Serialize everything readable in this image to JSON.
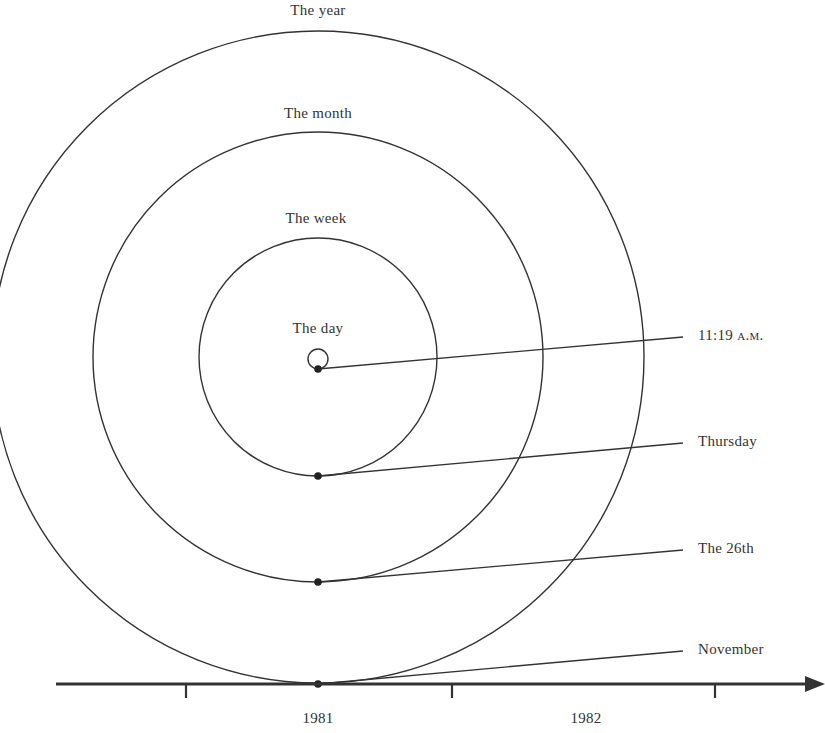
{
  "diagram": {
    "type": "nested-cycles-time-diagram",
    "circle_labels": {
      "year": "The year",
      "month": "The month",
      "week": "The week",
      "day": "The day"
    },
    "pointer_labels": {
      "time": "11:19",
      "time_suffix": "a.m.",
      "weekday": "Thursday",
      "date": "The 26th",
      "month": "November"
    },
    "axis": {
      "tick_labels": [
        "1981",
        "1982"
      ]
    },
    "colors": {
      "line": "#333333",
      "text": "#333333",
      "background": "#ffffff"
    }
  }
}
